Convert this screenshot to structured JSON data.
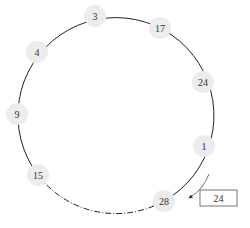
{
  "diagram": {
    "type": "hash-ring",
    "ring": {
      "cx": 113,
      "cy": 114,
      "r": 98,
      "stroke": "#222222"
    },
    "node_fill": "#ececec",
    "nodes": [
      {
        "label": "3",
        "x": 95,
        "y": 16
      },
      {
        "label": "17",
        "x": 160,
        "y": 28
      },
      {
        "label": "24",
        "x": 203,
        "y": 82
      },
      {
        "label": "1",
        "x": 204,
        "y": 146
      },
      {
        "label": "28",
        "x": 164,
        "y": 201
      },
      {
        "label": "15",
        "x": 38,
        "y": 175
      },
      {
        "label": "9",
        "x": 17,
        "y": 114
      },
      {
        "label": "4",
        "x": 37,
        "y": 52
      }
    ],
    "dashed_segment": {
      "from": "15",
      "to": "28",
      "style": "dash-dot"
    },
    "key_box": {
      "label": "24",
      "x": 200,
      "y": 190,
      "w": 37,
      "h": 16
    },
    "arrow": {
      "from": "1",
      "to": "28",
      "description": "lookup moves clockwise to next node"
    }
  }
}
